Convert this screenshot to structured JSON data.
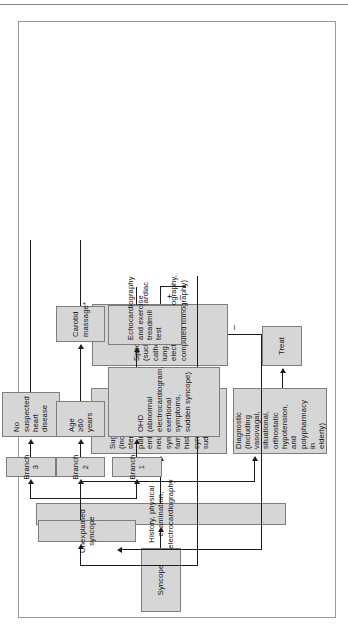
{
  "figure": {
    "type": "clinical-decision-flowchart",
    "orientation": "rotated-90-counterclockwise",
    "topic": "Evaluation of syncope"
  },
  "nodes": {
    "syncope": "Syncope",
    "history": "History, physical examination, electrocardiography",
    "diagnostic": "Diagnostic\n(including vasovagal,\nsituational, orthostatic\nhypotension, and\npolypharmacy in\nelderly)",
    "treat": "Treat",
    "suggestive": "Suggestive\n(including aortic\nstenosis, pulmonary\nembolism, neurological\nsymptoms, and family\nhistory of syncope or\nsudden death)",
    "specific_testing": "Specific testing\n(such as echo, cardiac\ncatheterization,\nlung scan,\nelectroencephalography,\ncomputed tomography)",
    "unexplained": "Unexplained syncope",
    "branch1": "Branch 1",
    "branch2": "Branch 2",
    "branch3": "Branch 3",
    "ohd": "OHD\n(abnormal\nelectrocardiogram,\nexertional symptoms,\nsudden syncope)",
    "echo_treadmill": "Echocardiography\nand exercise treadmill\ntest",
    "age60": "Age ≥60\nyears",
    "carotid": "Carotid\nmassage*",
    "no_heart_disease": "No suspected\nheart disease"
  },
  "signs": {
    "plus": "+",
    "minus": "–",
    "minus2": "–"
  },
  "colors": {
    "node_fill": "#d6d6d6",
    "node_border": "#7d7d7d",
    "connector": "#1c1c1c",
    "frame": "#9a9a9a",
    "page": "#ffffff"
  }
}
